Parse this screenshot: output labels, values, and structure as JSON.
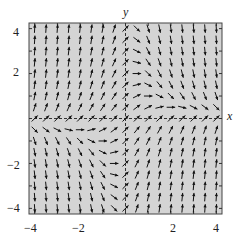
{
  "chart_data": {
    "type": "vector_field",
    "title": "",
    "xlabel": "x",
    "ylabel": "y",
    "xlim": [
      -4,
      4
    ],
    "ylim": [
      -4,
      4
    ],
    "xticks": [
      -4,
      -2,
      2,
      4
    ],
    "yticks": [
      -4,
      -2,
      2,
      4
    ],
    "minor_ticks_every": 1,
    "grid": false,
    "axes_style": "dashed",
    "field": {
      "dx": "1",
      "dy": "1 - x*y",
      "normalized": true
    },
    "sample_step": 0.5,
    "sample_range": [
      -4,
      4
    ],
    "background_color": "#d4d4d4",
    "arrow_color": "#111111"
  },
  "labels": {
    "x_axis": "x",
    "y_axis": "y",
    "xticks": [
      "−4",
      "−2",
      "2",
      "4"
    ],
    "yticks": [
      "4",
      "2",
      "−2",
      "−4"
    ]
  }
}
